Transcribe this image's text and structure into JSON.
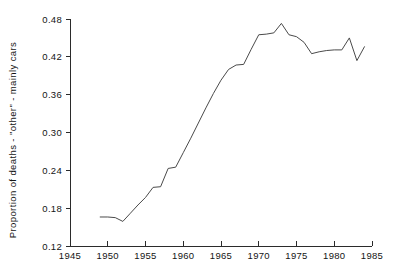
{
  "chart_data": {
    "type": "line",
    "title": "",
    "subtitle": "",
    "xlabel": "",
    "ylabel": "Proportion of deaths - \"other\" - mainly cars",
    "xlim": [
      1945,
      1985
    ],
    "ylim": [
      0.12,
      0.48
    ],
    "xticks": [
      1945,
      1950,
      1955,
      1960,
      1965,
      1970,
      1975,
      1980,
      1985
    ],
    "xtick_labels": [
      "1945",
      "1950",
      "1955",
      "1960",
      "1965",
      "1970",
      "1975",
      "1980",
      "1985"
    ],
    "yticks": [
      0.12,
      0.18,
      0.24,
      0.3,
      0.36,
      0.42,
      0.48
    ],
    "ytick_labels": [
      "0.12",
      "0.18",
      "0.24",
      "0.30",
      "0.36",
      "0.42",
      "0.48"
    ],
    "grid": false,
    "legend": false,
    "legend_position": "none",
    "line_color": "#4a4a4a",
    "axis_color": "#2b2b2b",
    "background_color": "#ffffff",
    "x": [
      1949,
      1950,
      1951,
      1952,
      1953,
      1954,
      1955,
      1956,
      1957,
      1958,
      1959,
      1960,
      1961,
      1962,
      1963,
      1964,
      1965,
      1966,
      1967,
      1968,
      1969,
      1970,
      1971,
      1972,
      1973,
      1974,
      1975,
      1976,
      1977,
      1978,
      1979,
      1980,
      1981,
      1982,
      1983,
      1984
    ],
    "values": [
      0.166,
      0.166,
      0.165,
      0.159,
      0.172,
      0.185,
      0.197,
      0.213,
      0.214,
      0.243,
      0.245,
      0.268,
      0.291,
      0.315,
      0.339,
      0.362,
      0.383,
      0.4,
      0.407,
      0.408,
      0.432,
      0.455,
      0.456,
      0.458,
      0.473,
      0.455,
      0.452,
      0.443,
      0.425,
      0.428,
      0.43,
      0.431,
      0.431,
      0.45,
      0.414,
      0.436
    ],
    "series": [
      {
        "name": "Proportion of deaths - \"other\" - mainly cars",
        "values": [
          0.166,
          0.166,
          0.165,
          0.159,
          0.172,
          0.185,
          0.197,
          0.213,
          0.214,
          0.243,
          0.245,
          0.268,
          0.291,
          0.315,
          0.339,
          0.362,
          0.383,
          0.4,
          0.407,
          0.408,
          0.432,
          0.455,
          0.456,
          0.458,
          0.473,
          0.455,
          0.452,
          0.443,
          0.425,
          0.428,
          0.43,
          0.431,
          0.431,
          0.45,
          0.414,
          0.436
        ]
      }
    ]
  }
}
